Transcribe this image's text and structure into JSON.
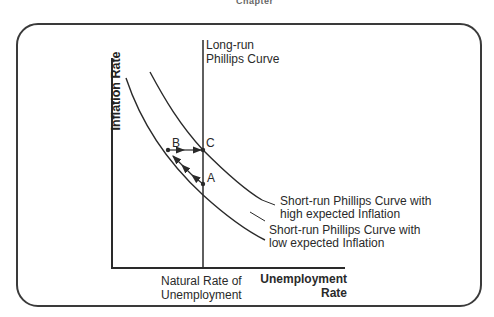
{
  "page_header": "Chapter",
  "diagram": {
    "y_axis_label": "Inflation Rate",
    "x_axis_label_line1": "Unemployment",
    "x_axis_label_line2": "Rate",
    "natural_rate_line1": "Natural Rate of",
    "natural_rate_line2": "Unemployment",
    "lrpc_line1": "Long-run",
    "lrpc_line2": "Phillips Curve",
    "srpc_high_line1": "Short-run Phillips Curve with",
    "srpc_high_line2": "high expected Inflation",
    "srpc_low_line1": "Short-run Phillips Curve with",
    "srpc_low_line2": "low expected Inflation",
    "points": {
      "A": "A",
      "B": "B",
      "C": "C"
    },
    "colors": {
      "line": "#2a2a2a",
      "frame": "#3a3a3a",
      "background": "#ffffff"
    }
  }
}
